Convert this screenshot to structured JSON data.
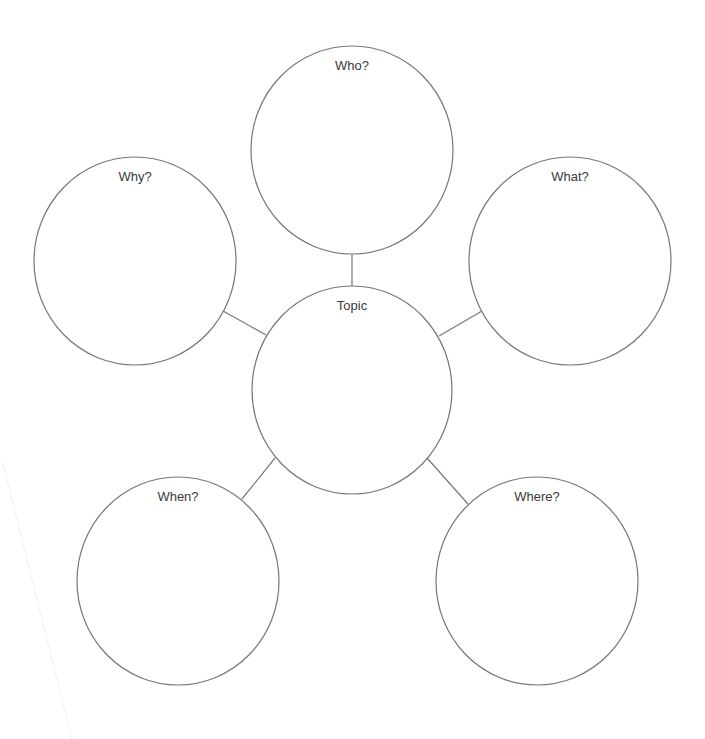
{
  "diagram": {
    "type": "5W graphic organizer / bubble map",
    "stroke_color": "#777777",
    "background": "#ffffff",
    "center": {
      "label": "Topic",
      "cx": 352,
      "cy": 390,
      "rx": 100,
      "ry": 104
    },
    "nodes": [
      {
        "id": "who",
        "label": "Who?",
        "cx": 352,
        "cy": 150,
        "rx": 101,
        "ry": 104,
        "label_y": 20
      },
      {
        "id": "why",
        "label": "Why?",
        "cx": 135,
        "cy": 261,
        "rx": 101,
        "ry": 104,
        "label_y": 20
      },
      {
        "id": "what",
        "label": "What?",
        "cx": 570,
        "cy": 261,
        "rx": 101,
        "ry": 104,
        "label_y": 20
      },
      {
        "id": "when",
        "label": "When?",
        "cx": 178,
        "cy": 581,
        "rx": 101,
        "ry": 104,
        "label_y": 20
      },
      {
        "id": "where",
        "label": "Where?",
        "cx": 537,
        "cy": 581,
        "rx": 101,
        "ry": 104,
        "label_y": 20
      }
    ],
    "connectors": [
      {
        "from": "who",
        "x1": 352,
        "y1": 254,
        "x2": 352,
        "y2": 286
      },
      {
        "from": "why",
        "x1": 223,
        "y1": 311,
        "x2": 266,
        "y2": 335
      },
      {
        "from": "what",
        "x1": 482,
        "y1": 311,
        "x2": 439,
        "y2": 336
      },
      {
        "from": "when",
        "x1": 242,
        "y1": 499,
        "x2": 275,
        "y2": 458
      },
      {
        "from": "where",
        "x1": 468,
        "y1": 504,
        "x2": 427,
        "y2": 458
      }
    ]
  }
}
